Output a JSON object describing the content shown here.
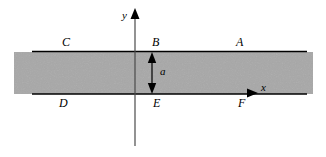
{
  "figure": {
    "background_color": "#ffffff",
    "slab_fill_color": "#a8a8a8",
    "line_color": "#000000",
    "width": 326,
    "height": 157
  },
  "axes": {
    "x_label": "x",
    "y_label": "y",
    "x_origin_px": 135,
    "y_origin_px": 94
  },
  "dimension": {
    "label": "a",
    "description": "slab thickness between top edge B and bottom edge E"
  },
  "point_labels": [
    {
      "id": "C",
      "text": "C",
      "x": 62,
      "y": 36,
      "position": "top-left"
    },
    {
      "id": "B",
      "text": "B",
      "x": 152,
      "y": 36,
      "position": "top-center"
    },
    {
      "id": "A",
      "text": "A",
      "x": 236,
      "y": 36,
      "position": "top-right"
    },
    {
      "id": "D",
      "text": "D",
      "x": 59,
      "y": 97,
      "position": "bottom-left"
    },
    {
      "id": "E",
      "text": "E",
      "x": 153,
      "y": 97,
      "position": "bottom-center"
    },
    {
      "id": "F",
      "text": "F",
      "x": 238,
      "y": 97,
      "position": "bottom-right"
    }
  ],
  "slab": {
    "left_px": 14,
    "right_px": 313,
    "top_px": 52,
    "bottom_px": 94,
    "edge_line_left_px": 32,
    "edge_line_right_px": 307
  }
}
